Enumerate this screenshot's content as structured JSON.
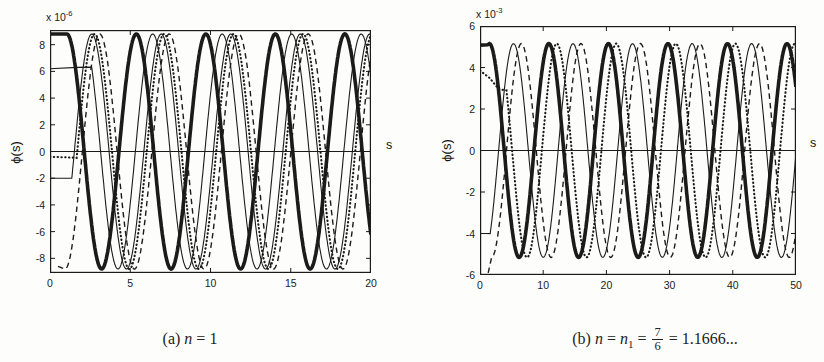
{
  "chart_data": [
    {
      "type": "line",
      "panel": "a",
      "title": "(a) n = 1",
      "xlabel": "s",
      "ylabel": "ϕ(s)",
      "scale": {
        "base": "x 10",
        "exp": "-6"
      },
      "xlim": [
        0,
        20
      ],
      "ylim": [
        -9.1,
        9.1
      ],
      "x_ticks": [
        0,
        5,
        10,
        15,
        20
      ],
      "y_ticks": [
        8,
        6,
        4,
        2,
        0,
        -2,
        -4,
        -6,
        -8
      ],
      "grid": false,
      "legend": "none",
      "zero_line": true,
      "caption": {
        "prefix": "(a)",
        "n": "n",
        "eq": " = 1"
      },
      "series": [
        {
          "name": "thick-solid",
          "style": "solid",
          "width": 3.6,
          "amplitude": 8.8,
          "period": 4.33,
          "peak_s": 1.05,
          "pre": [
            [
              0,
              8.8
            ]
          ],
          "from_s": 1.05
        },
        {
          "name": "thin-solid-1",
          "style": "solid",
          "width": 1.1,
          "amplitude": 8.8,
          "period": 4.33,
          "peak_s": 6.4,
          "pre": [
            [
              0,
              6.2
            ],
            [
              1.7,
              6.3
            ]
          ],
          "from_s": 2.6
        },
        {
          "name": "thin-solid-2",
          "style": "solid",
          "width": 1.1,
          "amplitude": 8.8,
          "period": 4.33,
          "peak_s": 2.6,
          "pre": [
            [
              0,
              -2.0
            ],
            [
              1.15,
              -2.0
            ]
          ],
          "from_s": 1.36
        },
        {
          "name": "dotted",
          "style": "dotted",
          "width": 2.1,
          "amplitude": 8.8,
          "period": 4.33,
          "peak_s": 2.78,
          "pre": [
            [
              0,
              -0.4
            ],
            [
              1.3,
              -0.45
            ]
          ],
          "from_s": 1.66
        },
        {
          "name": "dashed",
          "style": "dashed",
          "width": 1.4,
          "amplitude": 8.8,
          "period": 4.33,
          "peak_s": 3.1,
          "pre": [
            [
              0.5,
              -8.6
            ]
          ],
          "from_s": 0.935
        }
      ]
    },
    {
      "type": "line",
      "panel": "b",
      "title": "(b) n = n1 = 7/6 = 1.1666...",
      "xlabel": "s",
      "ylabel": "ϕ(s)",
      "scale": {
        "base": "x 10",
        "exp": "-3"
      },
      "xlim": [
        0,
        50
      ],
      "ylim": [
        -6,
        6
      ],
      "x_ticks": [
        0,
        10,
        20,
        30,
        40,
        50
      ],
      "y_ticks": [
        6,
        4,
        2,
        0,
        -2,
        -4,
        -6
      ],
      "grid": false,
      "legend": "none",
      "zero_line": true,
      "caption": {
        "prefix": "(b)",
        "n1": "n",
        "eq1": " = ",
        "n2": "n",
        "sub": "1",
        "eq2": " = ",
        "num": "7",
        "den": "6",
        "eq3": " = 1.1666..."
      },
      "series": [
        {
          "name": "thick-solid",
          "style": "solid",
          "width": 3.6,
          "amplitude": 5.15,
          "period": 9.42,
          "peak_s": 1.48,
          "pre": [
            [
              0,
              5.08
            ],
            [
              1.2,
              5.1
            ]
          ],
          "from_s": 1.48
        },
        {
          "name": "thin-solid",
          "style": "solid",
          "width": 1.1,
          "amplitude": 5.15,
          "period": 9.42,
          "peak_s": 5.3,
          "pre": [
            [
              0,
              -4.0
            ],
            [
              0.9,
              -4.0
            ]
          ],
          "from_s": 1.61
        },
        {
          "name": "dashed",
          "style": "dashed",
          "width": 1.4,
          "amplitude": 5.15,
          "period": 9.42,
          "peak_s": 6.55,
          "pre": [
            [
              1.3,
              -5.9
            ]
          ],
          "from_s": 1.84
        },
        {
          "name": "dotted",
          "style": "dotted",
          "width": 2.1,
          "amplitude": 5.15,
          "period": 9.42,
          "peak_s": 12.15,
          "pre": [
            [
              0,
              3.85
            ],
            [
              1.5,
              3.5
            ],
            [
              3.0,
              2.95
            ]
          ],
          "from_s": 4.19
        }
      ]
    }
  ]
}
